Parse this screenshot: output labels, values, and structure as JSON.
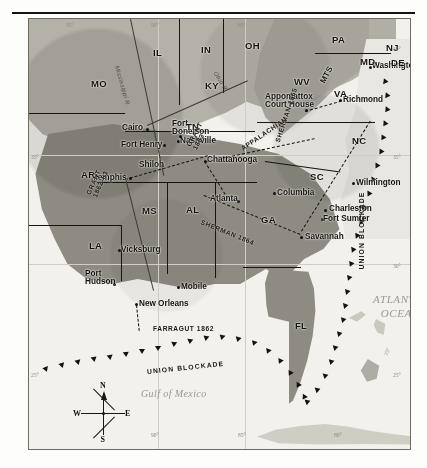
{
  "map": {
    "title": "American Civil War theater map",
    "oceans": [
      {
        "name": "ATLANTIC\nOCEAN",
        "x": 352,
        "y": 280
      },
      {
        "name": "Gulf of Mexico",
        "x": 120,
        "y": 375
      }
    ],
    "states": [
      {
        "abbr": "MO",
        "x": 62,
        "y": 60
      },
      {
        "abbr": "IL",
        "x": 124,
        "y": 29
      },
      {
        "abbr": "IN",
        "x": 172,
        "y": 26
      },
      {
        "abbr": "OH",
        "x": 216,
        "y": 22
      },
      {
        "abbr": "PA",
        "x": 303,
        "y": 16
      },
      {
        "abbr": "NJ",
        "x": 357,
        "y": 24
      },
      {
        "abbr": "MD",
        "x": 331,
        "y": 38
      },
      {
        "abbr": "DE",
        "x": 362,
        "y": 39
      },
      {
        "abbr": "WV",
        "x": 265,
        "y": 58
      },
      {
        "abbr": "VA",
        "x": 305,
        "y": 70
      },
      {
        "abbr": "KY",
        "x": 176,
        "y": 62
      },
      {
        "abbr": "TN",
        "x": 157,
        "y": 103
      },
      {
        "abbr": "NC",
        "x": 323,
        "y": 117
      },
      {
        "abbr": "SC",
        "x": 281,
        "y": 153
      },
      {
        "abbr": "GA",
        "x": 232,
        "y": 196
      },
      {
        "abbr": "AL",
        "x": 157,
        "y": 186
      },
      {
        "abbr": "MS",
        "x": 113,
        "y": 187
      },
      {
        "abbr": "AR",
        "x": 52,
        "y": 151
      },
      {
        "abbr": "LA",
        "x": 60,
        "y": 222
      },
      {
        "abbr": "FL",
        "x": 266,
        "y": 302
      },
      {
        "abbr": "MTS",
        "x": 289,
        "y": 52
      }
    ],
    "cities": [
      {
        "name": "Washington, D.C.",
        "lx": 343,
        "ly": 43,
        "dx": 340,
        "dy": 47,
        "anchor": "left"
      },
      {
        "name": "Richmond",
        "lx": 314,
        "ly": 77,
        "dx": 310,
        "dy": 80,
        "anchor": "left"
      },
      {
        "name": "Appomattox\nCourt House",
        "lx": 236,
        "ly": 74,
        "dx": 276,
        "dy": 90,
        "anchor": "left",
        "two": true
      },
      {
        "name": "Wilmington",
        "lx": 327,
        "ly": 160,
        "dx": 323,
        "dy": 163,
        "anchor": "left"
      },
      {
        "name": "Charleston",
        "lx": 300,
        "ly": 186,
        "dx": 295,
        "dy": 190,
        "anchor": "left"
      },
      {
        "name": "Fort Sumter",
        "lx": 294,
        "ly": 196,
        "dx": 292,
        "dy": 199,
        "anchor": "left"
      },
      {
        "name": "Savannah",
        "lx": 276,
        "ly": 214,
        "dx": 271,
        "dy": 217,
        "anchor": "left"
      },
      {
        "name": "Columbia",
        "lx": 248,
        "ly": 170,
        "dx": 244,
        "dy": 173,
        "anchor": "left"
      },
      {
        "name": "Atlanta",
        "lx": 181,
        "ly": 176,
        "dx": 208,
        "dy": 181,
        "anchor": "left"
      },
      {
        "name": "Chattanooga",
        "lx": 178,
        "ly": 137,
        "dx": 175,
        "dy": 141,
        "anchor": "left"
      },
      {
        "name": "Nashville",
        "lx": 151,
        "ly": 118,
        "dx": 148,
        "dy": 121,
        "anchor": "left"
      },
      {
        "name": "Fort\nDonelson",
        "lx": 143,
        "ly": 101,
        "dx": 150,
        "dy": 116,
        "anchor": "left",
        "two": true
      },
      {
        "name": "Cairo",
        "lx": 93,
        "ly": 105,
        "dx": 117,
        "dy": 109,
        "anchor": "left"
      },
      {
        "name": "Fort Henry",
        "lx": 92,
        "ly": 122,
        "dx": 134,
        "dy": 125,
        "anchor": "left"
      },
      {
        "name": "Shiloh",
        "lx": 110,
        "ly": 142,
        "dx": 132,
        "dy": 145,
        "anchor": "left"
      },
      {
        "name": "Memphis",
        "lx": 62,
        "ly": 155,
        "dx": 100,
        "dy": 158,
        "anchor": "left"
      },
      {
        "name": "Vicksburg",
        "lx": 92,
        "ly": 227,
        "dx": 89,
        "dy": 230,
        "anchor": "left"
      },
      {
        "name": "Port\nHudson",
        "lx": 56,
        "ly": 251,
        "dx": 84,
        "dy": 264,
        "anchor": "left",
        "two": true
      },
      {
        "name": "New Orleans",
        "lx": 110,
        "ly": 281,
        "dx": 106,
        "dy": 284,
        "anchor": "left"
      },
      {
        "name": "Mobile",
        "lx": 152,
        "ly": 264,
        "dx": 148,
        "dy": 267,
        "anchor": "left"
      }
    ],
    "campaigns": [
      {
        "label": "GRANT\n1863",
        "x": 163,
        "y": 122,
        "rotate": -62,
        "two": true
      },
      {
        "label": "GRANT\n1862-63",
        "x": 63,
        "y": 170,
        "rotate": -66,
        "two": true
      },
      {
        "label": "SHERMAN 1864",
        "x": 172,
        "y": 200,
        "rotate": 22
      },
      {
        "label": "SHERMAN 1865",
        "x": 249,
        "y": 120,
        "rotate": -72
      },
      {
        "label": "FARRAGUT 1862",
        "x": 124,
        "y": 307,
        "rotate": 0
      },
      {
        "label": "APPALACHIAN",
        "x": 213,
        "y": 127,
        "rotate": -34
      }
    ],
    "blockade_labels": [
      {
        "text": "UNION BLOCKADE",
        "x": 118,
        "y": 350,
        "rotate": -6
      },
      {
        "text": "UNION BLOCKADE",
        "x": 333,
        "y": 247,
        "rotate": -90
      }
    ],
    "rivers": [
      {
        "name": "Mississippi R.",
        "x": 88,
        "y": 44,
        "rotate": 74
      },
      {
        "name": "Ohio R.",
        "x": 186,
        "y": 50,
        "rotate": 58
      }
    ],
    "graticule": {
      "top": [
        {
          "deg": "95°",
          "x": 44
        },
        {
          "deg": "90°",
          "x": 129
        },
        {
          "deg": "85°",
          "x": 216
        }
      ],
      "bottom": [
        {
          "deg": "90°",
          "x": 129
        },
        {
          "deg": "85°",
          "x": 216
        },
        {
          "deg": "80°",
          "x": 312
        }
      ],
      "right": [
        {
          "deg": "40°",
          "y": 28
        },
        {
          "deg": "35°",
          "y": 136
        },
        {
          "deg": "30°",
          "y": 245
        },
        {
          "deg": "25°",
          "y": 354
        }
      ],
      "left": [
        {
          "deg": "35°",
          "y": 136
        },
        {
          "deg": "25°",
          "y": 354
        }
      ],
      "inner": [
        {
          "deg": "75°",
          "x": 355,
          "y": 330
        }
      ]
    },
    "compass": {
      "x": 68,
      "y": 388,
      "north": "N",
      "south": "S",
      "east": "E",
      "west": "W"
    },
    "colors": {
      "union_land": "#b4b2a8",
      "confederate_land": "#8d8b82",
      "ocean": "#f2f1ec",
      "ink": "#14120e",
      "graticule": "#cfcdc6"
    }
  }
}
